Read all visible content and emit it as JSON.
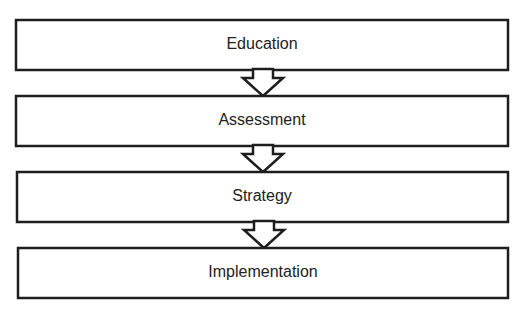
{
  "diagram": {
    "type": "vertical-flowchart",
    "colors": {
      "stroke": "#1e1e1e",
      "fill": "#ffffff",
      "text": "#222222"
    },
    "steps": [
      {
        "label": "Education"
      },
      {
        "label": "Assessment"
      },
      {
        "label": "Strategy"
      },
      {
        "label": "Implementation"
      }
    ],
    "connectors": [
      {
        "from": "Education",
        "to": "Assessment",
        "style": "block-arrow-down"
      },
      {
        "from": "Assessment",
        "to": "Strategy",
        "style": "block-arrow-down"
      },
      {
        "from": "Strategy",
        "to": "Implementation",
        "style": "block-arrow-down"
      }
    ]
  }
}
